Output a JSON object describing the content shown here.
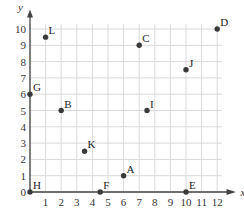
{
  "chart_data": {
    "type": "scatter",
    "title": "",
    "xlabel": "x",
    "ylabel": "y",
    "xlim": [
      0,
      12
    ],
    "ylim": [
      0,
      10
    ],
    "grid": true,
    "legend": null,
    "x_ticks": [
      0,
      1,
      2,
      3,
      4,
      5,
      6,
      7,
      8,
      9,
      10,
      11,
      12
    ],
    "y_ticks": [
      0,
      1,
      2,
      3,
      4,
      5,
      6,
      7,
      8,
      9,
      10
    ],
    "points": [
      {
        "label": "A",
        "x": 6,
        "y": 1
      },
      {
        "label": "B",
        "x": 2,
        "y": 5
      },
      {
        "label": "C",
        "x": 7,
        "y": 9
      },
      {
        "label": "D",
        "x": 12,
        "y": 10
      },
      {
        "label": "E",
        "x": 10,
        "y": 0
      },
      {
        "label": "F",
        "x": 4.5,
        "y": 0
      },
      {
        "label": "G",
        "x": 0,
        "y": 6
      },
      {
        "label": "H",
        "x": 0,
        "y": 0
      },
      {
        "label": "I",
        "x": 7.5,
        "y": 5
      },
      {
        "label": "J",
        "x": 10,
        "y": 7.5
      },
      {
        "label": "K",
        "x": 3.5,
        "y": 2.5
      },
      {
        "label": "L",
        "x": 1,
        "y": 9.5
      }
    ],
    "colors": {
      "grid": "#d9d9d9",
      "axis": "#444444",
      "point": "#3a3a3a"
    }
  }
}
